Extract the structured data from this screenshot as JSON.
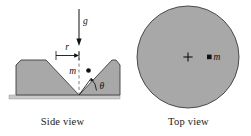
{
  "figure": {
    "captions": {
      "side_view": "Side view",
      "top_view": "Top view"
    },
    "labels": {
      "gravity": "g",
      "radius": "r",
      "mass_side": "m",
      "mass_top": "m",
      "angle": "θ"
    },
    "colors": {
      "fill_gray": "#a8a8a8",
      "outline": "#3c3c3c",
      "ground_gray": "#c4c4c4",
      "ink": "#111111",
      "background": "#ffffff"
    },
    "side_view": {
      "description": "V-shaped groove block resting on ground, point mass m on right incline at angle theta, distance r from vertical center axis, gravity g acting downward",
      "groove_angle_label": "θ",
      "center_axis": "dashed vertical line through V vertex",
      "gravity_arrow_direction": "down"
    },
    "top_view": {
      "description": "Circular disk seen from above with center marked by a cross and point mass m offset to the right",
      "center_marker": "+",
      "mass_marker": "filled dot"
    }
  }
}
